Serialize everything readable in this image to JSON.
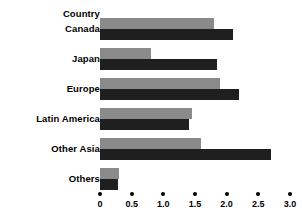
{
  "chart_data": {
    "type": "bar",
    "orientation": "horizontal",
    "title": "",
    "xlabel": "",
    "ylabel": "Country",
    "header_label": "Country",
    "categories": [
      "Canada",
      "Japan",
      "Europe",
      "Latin America",
      "Other Asia",
      "Others"
    ],
    "series": [
      {
        "name": "light-series",
        "color": "#8a8a8a",
        "values": [
          1.8,
          0.8,
          1.9,
          1.45,
          1.6,
          0.3
        ]
      },
      {
        "name": "dark-series",
        "color": "#1f1f1f",
        "values": [
          2.1,
          1.85,
          2.2,
          1.4,
          2.7,
          0.28
        ]
      }
    ],
    "xlim": [
      0,
      3.0
    ],
    "xticks": [
      0,
      0.5,
      1.0,
      1.5,
      2.0,
      2.5,
      3.0
    ],
    "xtick_labels": [
      "0",
      "0.5",
      "1.0",
      "1.5",
      "2.0",
      "2.5",
      "3.0"
    ],
    "grid": false,
    "legend": "none",
    "tick_marker": "dot"
  },
  "colors": {
    "background": "#ffffff",
    "text": "#000000",
    "light_bar": "#8a8a8a",
    "dark_bar": "#1f1f1f"
  }
}
